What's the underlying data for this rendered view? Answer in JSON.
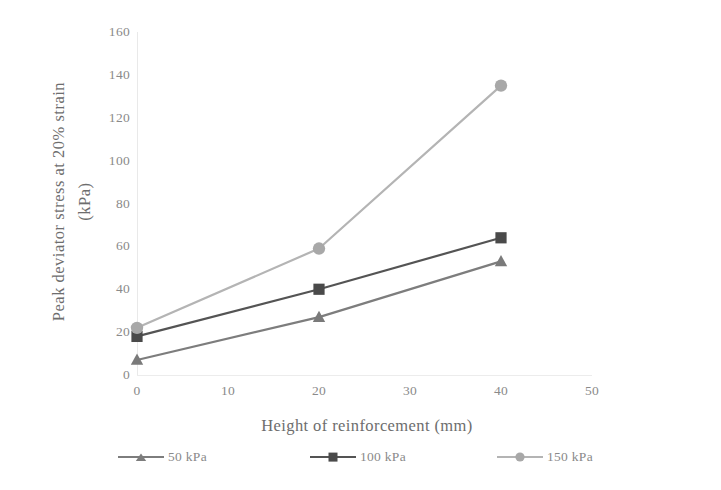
{
  "chart_data": {
    "type": "line",
    "title": "",
    "xlabel": "Height of reinforcement (mm)",
    "ylabel_line1": "Peak deviator stress at  20% strain",
    "ylabel_line2": "(kPa)",
    "x": [
      0,
      20,
      40
    ],
    "xlim": [
      0,
      50
    ],
    "ylim": [
      0,
      160
    ],
    "xticks": [
      "0",
      "10",
      "20",
      "30",
      "40",
      "50"
    ],
    "xtick_values": [
      0,
      10,
      20,
      30,
      40,
      50
    ],
    "yticks": [
      "0",
      "20",
      "40",
      "60",
      "80",
      "100",
      "120",
      "140",
      "160"
    ],
    "ytick_values": [
      0,
      20,
      40,
      60,
      80,
      100,
      120,
      140,
      160
    ],
    "grid": false,
    "legend_position": "bottom",
    "series": [
      {
        "name": "50 kPa",
        "marker": "triangle",
        "color": "#7d7d7d",
        "values": [
          7,
          27,
          53
        ]
      },
      {
        "name": "100 kPa",
        "marker": "square",
        "color": "#545454",
        "values": [
          18,
          40,
          64
        ]
      },
      {
        "name": "150 kPa",
        "marker": "circle",
        "color": "#b4b4b4",
        "values": [
          22,
          59,
          135
        ]
      }
    ]
  },
  "legend": {
    "items": [
      {
        "label": "50 kPa"
      },
      {
        "label": "100 kPa"
      },
      {
        "label": "150 kPa"
      }
    ]
  }
}
